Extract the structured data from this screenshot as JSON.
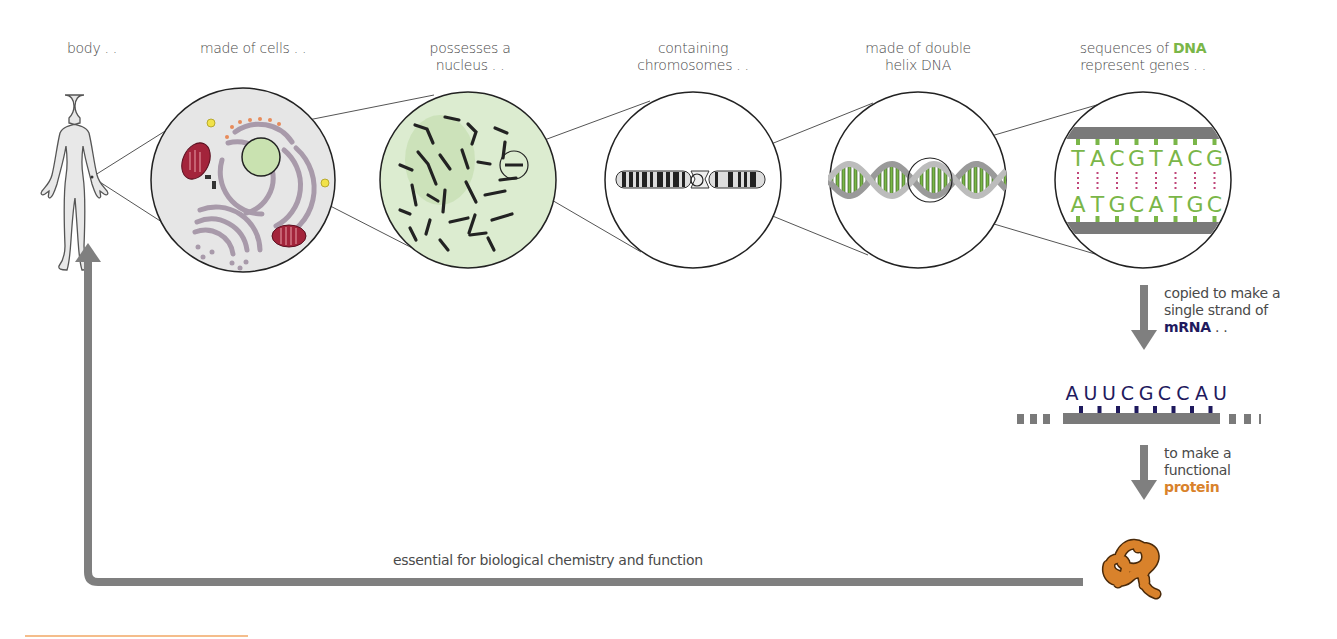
{
  "stages": [
    {
      "id": "body",
      "line1": "body . .",
      "line2": ""
    },
    {
      "id": "cells",
      "line1": "made of cells . .",
      "line2": ""
    },
    {
      "id": "nucleus",
      "line1": "possesses a",
      "line2": "nucleus . ."
    },
    {
      "id": "chromosomes",
      "line1": "containing",
      "line2": "chromosomes . ."
    },
    {
      "id": "double-helix",
      "line1": "made of double",
      "line2": "helix DNA"
    },
    {
      "id": "genes",
      "line1_prefix": "sequences of ",
      "line1_highlight": "DNA",
      "line2": "represent genes . ."
    }
  ],
  "dna": {
    "top_strand": [
      "T",
      "A",
      "C",
      "G",
      "T",
      "A",
      "C",
      "G"
    ],
    "bottom_strand": [
      "A",
      "T",
      "G",
      "C",
      "A",
      "T",
      "G",
      "C"
    ]
  },
  "mrna_step": {
    "line1": "copied to make a",
    "line2": "single strand of",
    "highlight": "mRNA",
    "suffix": " . .",
    "sequence": [
      "A",
      "U",
      "U",
      "C",
      "G",
      "C",
      "C",
      "A",
      "U"
    ]
  },
  "protein_step": {
    "line1": "to make a",
    "line2": "functional",
    "highlight": "protein"
  },
  "return_label": "essential for biological chemistry and function",
  "colors": {
    "dna_green": "#7ab648",
    "mrna_navy": "#1f1a5e",
    "protein_orange": "#d9822b",
    "arrow_gray": "#7f7f7f",
    "nucleus_fill": "#dcecd0",
    "mitochondria": "#a3243b"
  }
}
